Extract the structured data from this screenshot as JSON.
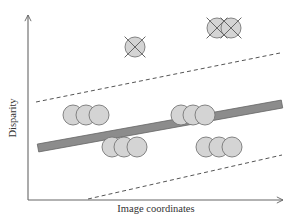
{
  "figure": {
    "xlabel": "Image coordinates",
    "ylabel": "Disparity",
    "colors": {
      "axis": "#666666",
      "circle_fill": "#d4d4d4",
      "circle_stroke": "#777777",
      "bar_fill": "#8c8c8c",
      "bar_stroke": "#666666",
      "dash": "#555555",
      "cross": "#666666",
      "text": "#333333"
    },
    "axes": {
      "origin": [
        28,
        200
      ],
      "y_top": [
        28,
        15
      ],
      "x_end": [
        283,
        200
      ]
    },
    "bar": {
      "x1": 38,
      "y1": 148,
      "x2": 282,
      "y2": 104,
      "thickness": 8
    },
    "dashed_upper": {
      "x1": 36,
      "y1": 102,
      "x2": 280,
      "y2": 53
    },
    "dashed_lower": {
      "x1": 88,
      "y1": 199,
      "x2": 282,
      "y2": 155
    },
    "circle_radius": 10,
    "inlier_groups": [
      {
        "name": "group-left-upper",
        "points": [
          [
            73,
            115
          ],
          [
            86,
            115
          ],
          [
            99,
            115
          ]
        ]
      },
      {
        "name": "group-mid-upper",
        "points": [
          [
            181,
            115
          ],
          [
            193,
            115
          ],
          [
            205,
            115
          ]
        ]
      },
      {
        "name": "group-left-lower",
        "points": [
          [
            112,
            147
          ],
          [
            124,
            147
          ],
          [
            137,
            147
          ]
        ]
      },
      {
        "name": "group-right-lower",
        "points": [
          [
            206,
            147
          ],
          [
            219,
            147
          ],
          [
            232,
            147
          ]
        ]
      }
    ],
    "outliers": [
      {
        "name": "outlier-single",
        "points": [
          [
            135,
            47
          ]
        ]
      },
      {
        "name": "outlier-pair",
        "points": [
          [
            217,
            28
          ],
          [
            231,
            28
          ]
        ]
      }
    ]
  }
}
